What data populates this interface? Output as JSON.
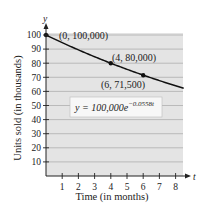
{
  "chart_data": {
    "type": "line",
    "title": "",
    "xlabel": "Time (in months)",
    "ylabel": "Units sold (in thousands)",
    "x_axis_var": "t",
    "y_axis_var": "y",
    "xlim": [
      0,
      8.5
    ],
    "ylim": [
      0,
      100
    ],
    "x_ticks": [
      1,
      2,
      3,
      4,
      5,
      6,
      7,
      8
    ],
    "y_ticks": [
      10,
      20,
      30,
      40,
      50,
      60,
      70,
      80,
      90,
      100
    ],
    "grid": "horizontal",
    "series": [
      {
        "name": "y = 100,000e^(-0.0558t)",
        "function": "100 * exp(-0.0558 * t)",
        "x": [
          0,
          1,
          2,
          3,
          4,
          5,
          6,
          7,
          8,
          8.5
        ],
        "values": [
          100,
          94.6,
          89.4,
          84.6,
          80.0,
          75.7,
          71.5,
          67.7,
          64.0,
          62.2
        ]
      }
    ],
    "highlighted_points": [
      {
        "x": 0,
        "y": 100,
        "label": "(0, 100,000)"
      },
      {
        "x": 4,
        "y": 80,
        "label": "(4, 80,000)"
      },
      {
        "x": 6,
        "y": 71.5,
        "label": "(6, 71,500)"
      }
    ],
    "annotations": [
      {
        "text": "y = 100,000e",
        "superscript": "−0.0558t"
      }
    ]
  },
  "labels": {
    "x_title": "Time (in months)",
    "y_title": "Units sold (in thousands)",
    "x_var": "t",
    "y_var": "y",
    "equation_base": "y = 100,000e",
    "equation_exp": "−0.0558t",
    "pt0": "(0, 100,000)",
    "pt1": "(4, 80,000)",
    "pt2": "(6, 71,500)"
  },
  "colors": {
    "plot_bg": "#e4e4e4",
    "grid": "#a8a8a8",
    "curve": "#111111",
    "axis": "#222222",
    "eq_box_bg": "#f7f7f7",
    "eq_box_border": "#bdbdbd"
  }
}
